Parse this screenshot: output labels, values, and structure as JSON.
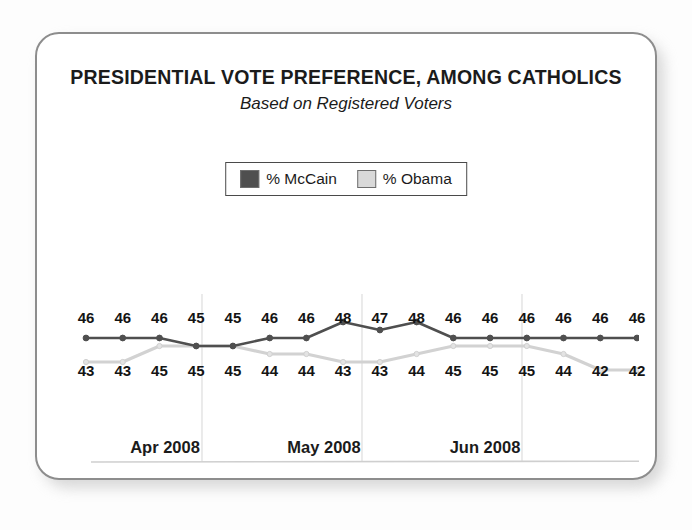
{
  "card": {
    "title": "PRESIDENTIAL VOTE PREFERENCE, AMONG CATHOLICS",
    "subtitle": "Based on Registered Voters"
  },
  "legend": {
    "position": "top-center",
    "items": [
      {
        "label": "% McCain",
        "color": "#4f4f4f",
        "icon": "legend-swatch-mccain"
      },
      {
        "label": "% Obama",
        "color": "#d5d5d5",
        "icon": "legend-swatch-obama"
      }
    ]
  },
  "axis": {
    "ticks": [
      "Apr 2008",
      "May 2008",
      "Jun 2008"
    ],
    "gridlines": 3,
    "baseline": true
  },
  "chart_data": {
    "type": "line",
    "title": "PRESIDENTIAL VOTE PREFERENCE, AMONG CATHOLICS",
    "subtitle": "Based on Registered Voters",
    "xlabel": "",
    "ylabel": "",
    "ylim": [
      40,
      50
    ],
    "grid": true,
    "legend_position": "top-center",
    "categories": [
      "1",
      "2",
      "3",
      "4",
      "5",
      "6",
      "7",
      "8",
      "9",
      "10",
      "11",
      "12",
      "13",
      "14",
      "15",
      "16"
    ],
    "tick_labels": [
      "Apr 2008",
      "May 2008",
      "Jun 2008"
    ],
    "series": [
      {
        "name": "% McCain",
        "color": "#4f4f4f",
        "label_row": "top",
        "values": [
          46,
          46,
          46,
          45,
          45,
          46,
          46,
          48,
          47,
          48,
          46,
          46,
          46,
          46,
          46,
          46
        ]
      },
      {
        "name": "% Obama",
        "color": "#d2d2d2",
        "label_row": "bottom",
        "values": [
          43,
          43,
          45,
          45,
          45,
          44,
          44,
          43,
          43,
          44,
          45,
          45,
          45,
          44,
          42,
          42
        ]
      }
    ],
    "point_labels_top": [
      46,
      46,
      46,
      45,
      45,
      46,
      46,
      48,
      47,
      48,
      46,
      46,
      46,
      46,
      46,
      46
    ],
    "point_labels_bottom": [
      43,
      43,
      45,
      45,
      45,
      44,
      44,
      43,
      43,
      44,
      45,
      45,
      45,
      44,
      42,
      42
    ]
  },
  "colors": {
    "mccain": "#4f4f4f",
    "obama": "#d5d5d5",
    "border": "#8d8d8d",
    "text": "#1b1b1b",
    "grid": "#e2e2e2"
  }
}
